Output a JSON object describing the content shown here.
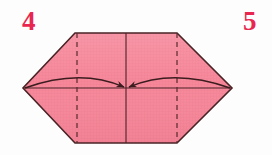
{
  "figure": {
    "background_color": "#fdfdfd"
  },
  "labels": {
    "step_left": "4",
    "step_right": "5",
    "step_color": "#e8264f"
  },
  "paper": {
    "fill_color": "#f4879b",
    "fill_color_light": "#f79eae",
    "outline_color": "#4a2326",
    "grid_color": "#e0758b",
    "outline_width": 1.6
  },
  "geometry": {
    "hexagon_points": "75,33 177,33 232,88 177,143 75,143 23,88",
    "vertices": [
      {
        "name": "top-left",
        "x": 75,
        "y": 33
      },
      {
        "name": "top-right",
        "x": 177,
        "y": 33
      },
      {
        "name": "right-point",
        "x": 232,
        "y": 88
      },
      {
        "name": "bottom-right",
        "x": 177,
        "y": 143
      },
      {
        "name": "bottom-left",
        "x": 75,
        "y": 143
      },
      {
        "name": "left-point",
        "x": 23,
        "y": 88
      }
    ],
    "center": {
      "x": 126,
      "y": 88
    },
    "horizontal_crease": {
      "x1": 23,
      "y1": 88,
      "x2": 232,
      "y2": 88
    },
    "vertical_crease": {
      "x": 126,
      "y1": 33,
      "y2": 143
    },
    "dashed_line_left": {
      "x": 77,
      "y1": 33,
      "y2": 143
    },
    "dashed_line_right": {
      "x": 177,
      "y1": 33,
      "y2": 143
    },
    "dash_pattern": "5,4"
  },
  "arrows": {
    "left": {
      "name": "fold-arrow-left",
      "path": "M 25 88 Q 80 68 124 87",
      "direction": "left-point-to-center"
    },
    "right": {
      "name": "fold-arrow-right",
      "path": "M 230 88 Q 174 68 129 87",
      "direction": "right-point-to-center"
    },
    "color": "#3b1c1f",
    "width": 1.5
  }
}
